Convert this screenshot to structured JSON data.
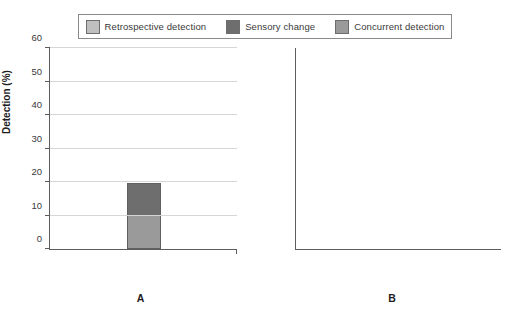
{
  "legend": {
    "items": [
      {
        "label": "Retrospective detection",
        "color": "#bfbfbf",
        "key": "retrospective"
      },
      {
        "label": "Sensory change",
        "color": "#6e6e6e",
        "key": "sensory"
      },
      {
        "label": "Concurrent detection",
        "color": "#9a9a9a",
        "key": "concurrent"
      }
    ]
  },
  "axis": {
    "ylabel": "Detection (%)",
    "ticks": [
      "0",
      "10",
      "20",
      "30",
      "40",
      "50",
      "60"
    ]
  },
  "panels": [
    {
      "tag": "A",
      "categories": [
        {
          "lines": [
            "Blackcurrant",
            "vs. blueberry"
          ]
        },
        {
          "lines": [
            "Ginger",
            "vs. lime"
          ]
        },
        {
          "lines": [
            "Cinnamon",
            "apple",
            "vs. grapefruit"
          ]
        }
      ]
    },
    {
      "tag": "B",
      "categories": [
        {
          "lines": [
            "Apple pie",
            "vs. honey"
          ]
        },
        {
          "lines": [
            "Caramel and",
            "cream",
            "vs. cinnamon"
          ]
        },
        {
          "lines": [
            "Pernod",
            "vs. mango"
          ]
        }
      ]
    }
  ],
  "chart_data": {
    "type": "bar",
    "title": "",
    "xlabel": "",
    "ylabel": "Detection (%)",
    "ylim": [
      0,
      60
    ],
    "yticks": [
      0,
      10,
      20,
      30,
      40,
      50,
      60
    ],
    "grid": true,
    "stacked": true,
    "legend_position": "top",
    "panels": [
      {
        "label": "A",
        "categories": [
          "Blackcurrant vs. blueberry",
          "Ginger vs. lime",
          "Cinnamon apple vs. grapefruit"
        ],
        "series": [
          {
            "name": "Concurrent detection",
            "color": "#9a9a9a",
            "values": [
              10,
              12.5,
              20.5
            ]
          },
          {
            "name": "Sensory change",
            "color": "#6e6e6e",
            "values": [
              10,
              13.5,
              18
            ]
          },
          {
            "name": "Retrospective detection",
            "color": "#bfbfbf",
            "values": [
              0,
              10,
              7
            ]
          }
        ],
        "totals": [
          20,
          36,
          45.5
        ]
      },
      {
        "label": "B",
        "categories": [
          "Apple pie vs. honey",
          "Caramel and cream vs. cinnamon",
          "Pernod vs. mango"
        ],
        "series": [
          {
            "name": "Concurrent detection",
            "color": "#9a9a9a",
            "values": [
              7,
              11,
              23.5
            ]
          },
          {
            "name": "Sensory change",
            "color": "#6e6e6e",
            "values": [
              7.5,
              11,
              24
            ]
          },
          {
            "name": "Retrospective detection",
            "color": "#bfbfbf",
            "values": [
              0,
              11.5,
              3
            ]
          }
        ],
        "totals": [
          14.5,
          33.5,
          50.5
        ]
      }
    ]
  }
}
